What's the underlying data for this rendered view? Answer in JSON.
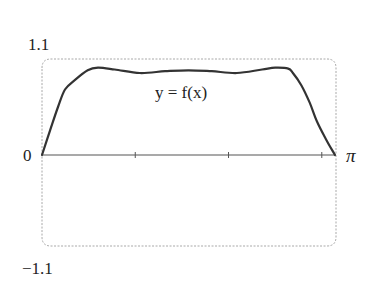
{
  "chart_data": {
    "type": "line",
    "title": "",
    "xlabel": "",
    "ylabel": "",
    "xlim": [
      0,
      3.14159
    ],
    "ylim": [
      -1.1,
      1.1
    ],
    "grid": false,
    "legend": null,
    "x_tick_positions": [
      1,
      2,
      3
    ],
    "x_tick_labels": {
      "start": "0",
      "end": "π"
    },
    "y_tick_labels": {
      "top": "1.1",
      "bottom": "−1.1"
    },
    "annotations": [
      {
        "text": "y = f(x)",
        "x": 1.6,
        "y": 0.72
      }
    ],
    "series": [
      {
        "name": "y = f(x)",
        "x": [
          0,
          0.086,
          0.172,
          0.247,
          0.354,
          0.49,
          0.6,
          0.78,
          1.05,
          1.32,
          1.571,
          1.82,
          2.09,
          2.36,
          2.5,
          2.64,
          2.69,
          2.78,
          2.87,
          2.95,
          3.05,
          3.14159
        ],
        "y": [
          0,
          0.28,
          0.55,
          0.75,
          0.86,
          0.97,
          1.0,
          0.98,
          0.94,
          0.96,
          0.97,
          0.96,
          0.94,
          0.98,
          1.0,
          0.99,
          0.94,
          0.8,
          0.6,
          0.38,
          0.17,
          0
        ]
      }
    ]
  },
  "labels": {
    "y_top": "1.1",
    "y_bottom": "−1.1",
    "x_origin": "0",
    "x_end": "π",
    "curve_label_prefix": "y = ",
    "curve_label_func": "f",
    "curve_label_arg": "(x)"
  },
  "colors": {
    "curve": "#333333",
    "axis": "#555555",
    "frame": "#a8a8a8",
    "text": "#222222"
  }
}
